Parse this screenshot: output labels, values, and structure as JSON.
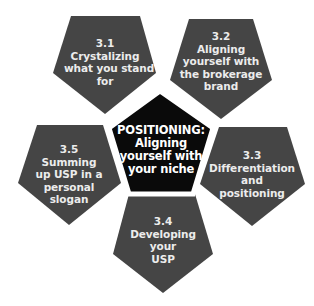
{
  "diagram": {
    "type": "pentagon-cluster",
    "colors": {
      "outer_fill": "#454545",
      "center_fill": "#0a0a0a",
      "center_border": "#ffffff",
      "text": "#ececec",
      "background": "#ffffff"
    },
    "center": {
      "lines": [
        "POSITIONING:",
        "Aligning",
        "yourself with",
        "your niche"
      ]
    },
    "nodes": [
      {
        "id": "3.1",
        "lines": [
          "3.1",
          "Crystalizing",
          "what you stand",
          "for"
        ]
      },
      {
        "id": "3.2",
        "lines": [
          "3.2",
          "Aligning",
          "yourself with",
          "the brokerage",
          "brand"
        ]
      },
      {
        "id": "3.3",
        "lines": [
          "3.3",
          "Differentiation",
          "and",
          "positioning"
        ]
      },
      {
        "id": "3.4",
        "lines": [
          "3.4",
          "Developing",
          "your",
          "USP"
        ]
      },
      {
        "id": "3.5",
        "lines": [
          "3.5",
          "Summing",
          "up USP in a",
          "personal",
          "slogan"
        ]
      }
    ]
  }
}
